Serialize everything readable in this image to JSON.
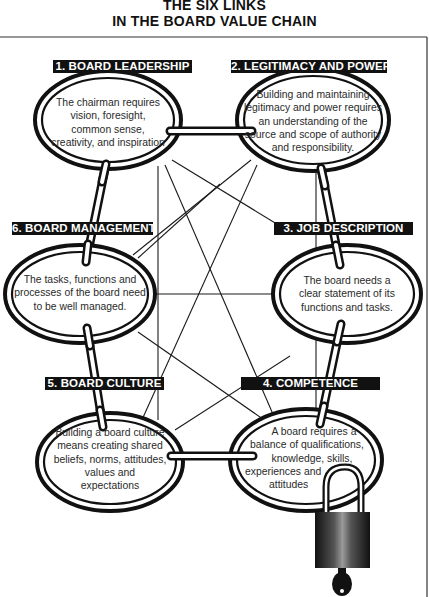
{
  "title": {
    "line1": "THE SIX LINKS",
    "line2": "IN THE BOARD VALUE CHAIN"
  },
  "links": [
    {
      "number": 1,
      "label": "1. BOARD LEADERSHIP",
      "text_lines": [
        "The chairman requires",
        "vision, foresight,",
        "common sense,",
        "creativity, and inspiration"
      ]
    },
    {
      "number": 2,
      "label": "2. LEGITIMACY AND POWER",
      "text_lines": [
        "Building and maintaining",
        "legitimacy and power requires",
        "an understanding of the",
        "source and scope of authority",
        "and responsibility."
      ]
    },
    {
      "number": 3,
      "label": "3. JOB DESCRIPTION",
      "text_lines": [
        "The board needs a",
        "clear statement of its",
        "functions and tasks."
      ]
    },
    {
      "number": 4,
      "label": "4. COMPETENCE",
      "text_lines": [
        "A board requires a",
        "balance of qualifications,",
        "knowledge, skills,",
        "experiences and",
        "attitudes"
      ]
    },
    {
      "number": 5,
      "label": "5. BOARD CULTURE",
      "text_lines": [
        "Building a board culture",
        "means creating shared",
        "beliefs, norms, attitudes,",
        "values and",
        "expectations"
      ]
    },
    {
      "number": 6,
      "label": "6. BOARD MANAGEMENT",
      "text_lines": [
        "The tasks, functions and",
        "processes of the board need",
        "to be well managed."
      ]
    }
  ],
  "icons": {
    "padlock": "padlock-icon",
    "key": "key-icon",
    "chain_link": "chain-link-icon"
  },
  "colors": {
    "ink": "#111111",
    "background": "#ffffff",
    "label_bg": "#111111",
    "label_text": "#ffffff"
  }
}
